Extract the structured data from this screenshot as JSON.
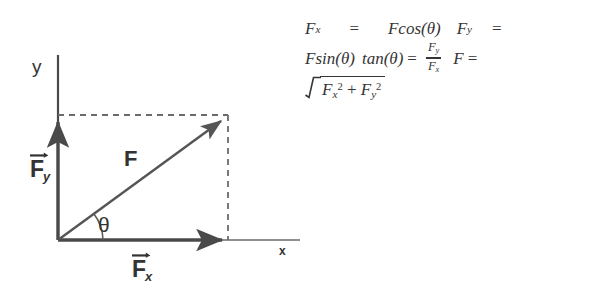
{
  "figure": {
    "type": "force-vector-decomposition-diagram",
    "axes": {
      "y_label": "y",
      "x_label": "x"
    },
    "labels": {
      "resultant": "F",
      "angle": "θ",
      "component_y_base": "F",
      "component_y_sub": "y",
      "component_x_base": "F",
      "component_x_sub": "x"
    },
    "geometry": {
      "origin_x": 58,
      "origin_y": 240,
      "tip_x": 228,
      "tip_y": 115,
      "y_axis_top": 55,
      "x_axis_right": 300,
      "angle_degrees": 36
    },
    "colors": {
      "background": "#ffffff",
      "ink": "#4a4a4a",
      "text": "#333333",
      "dashed": "#6b6b6b"
    }
  },
  "equations": {
    "line1": {
      "lhs_base": "F",
      "lhs_sub": "x",
      "eq": "=",
      "rhs_F": "F",
      "rhs_fn": "cos(θ)",
      "next_base": "F",
      "next_sub": "y",
      "next_eq": "="
    },
    "line2": {
      "F": "F",
      "fn_sin": "sin(θ)",
      "fn_tan": "tan(θ)",
      "eq": "=",
      "frac_num_base": "F",
      "frac_num_sub": "y",
      "frac_den_base": "F",
      "frac_den_sub": "x",
      "F2": "F",
      "eq2": "="
    },
    "line3": {
      "radicand_first_base": "F",
      "radicand_first_sub": "x",
      "radicand_first_sup": "2",
      "plus": "+",
      "radicand_second_base": "F",
      "radicand_second_sub": "y",
      "radicand_second_sup": "2"
    }
  }
}
